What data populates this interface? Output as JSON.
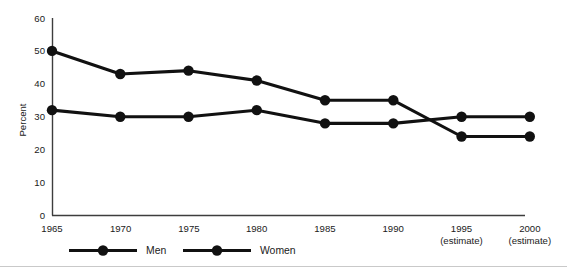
{
  "chart_data": {
    "type": "line",
    "title": "",
    "subtitle": "",
    "xlabel": "",
    "ylabel": "Percent",
    "categories": [
      "1965",
      "1970",
      "1975",
      "1980",
      "1985",
      "1990",
      "1995",
      "2000"
    ],
    "x_tick_sublabels": [
      "",
      "",
      "",
      "",
      "",
      "",
      "(estimate)",
      "(estimate)"
    ],
    "series": [
      {
        "name": "Men",
        "values": [
          50,
          43,
          44,
          41,
          35,
          35,
          24,
          24
        ]
      },
      {
        "name": "Women",
        "values": [
          32,
          30,
          30,
          32,
          28,
          28,
          30,
          30
        ]
      }
    ],
    "ylim": [
      0,
      60
    ],
    "y_ticks": [
      0,
      10,
      20,
      30,
      40,
      50,
      60
    ],
    "y_tick_labels": [
      "0",
      "10",
      "20",
      "30",
      "40",
      "50",
      "60"
    ],
    "xlim_index": [
      0,
      7
    ],
    "grid": false,
    "legend_position": "bottom",
    "colors": {
      "series_line": "#111111",
      "marker": "#111111",
      "axis": "#3d3d3d",
      "text": "#1a1a1a",
      "background": "#ffffff",
      "footer_rule": "#c9c9c9"
    }
  },
  "legend": {
    "items": [
      {
        "label": "Men"
      },
      {
        "label": "Women"
      }
    ]
  },
  "axes": {
    "y_axis_title": "Percent"
  }
}
